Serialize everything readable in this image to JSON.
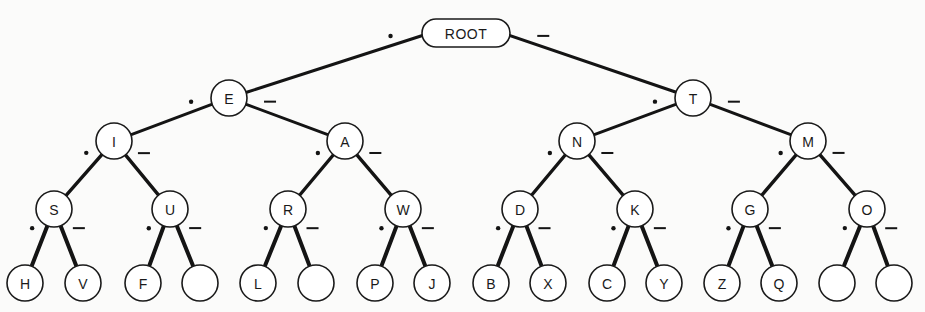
{
  "diagram": {
    "colors": {
      "line": "#141414",
      "node_fill": "#ffffff",
      "node_stroke": "#1a1a1a",
      "background": "#fbfbfa"
    },
    "edge_labels": {
      "dot": "•",
      "dash": "–"
    },
    "root": {
      "id": "root",
      "label": "ROOT",
      "x": 466,
      "y": 33,
      "w": 88,
      "h": 28
    },
    "nodes": [
      {
        "id": "E",
        "label": "E",
        "x": 229,
        "y": 98,
        "level": 1,
        "parent": "root",
        "edge": "dot"
      },
      {
        "id": "T",
        "label": "T",
        "x": 693,
        "y": 98,
        "level": 1,
        "parent": "root",
        "edge": "dash"
      },
      {
        "id": "I",
        "label": "I",
        "x": 114,
        "y": 141,
        "level": 2,
        "parent": "E",
        "edge": "dot"
      },
      {
        "id": "A",
        "label": "A",
        "x": 345,
        "y": 141,
        "level": 2,
        "parent": "E",
        "edge": "dash"
      },
      {
        "id": "N",
        "label": "N",
        "x": 577,
        "y": 141,
        "level": 2,
        "parent": "T",
        "edge": "dot"
      },
      {
        "id": "M",
        "label": "M",
        "x": 808,
        "y": 141,
        "level": 2,
        "parent": "T",
        "edge": "dash"
      },
      {
        "id": "S",
        "label": "S",
        "x": 54,
        "y": 209,
        "level": 3,
        "parent": "I",
        "edge": "dot"
      },
      {
        "id": "U",
        "label": "U",
        "x": 170,
        "y": 209,
        "level": 3,
        "parent": "I",
        "edge": "dash"
      },
      {
        "id": "R",
        "label": "R",
        "x": 288,
        "y": 209,
        "level": 3,
        "parent": "A",
        "edge": "dot"
      },
      {
        "id": "W",
        "label": "W",
        "x": 403,
        "y": 209,
        "level": 3,
        "parent": "A",
        "edge": "dash"
      },
      {
        "id": "D",
        "label": "D",
        "x": 520,
        "y": 209,
        "level": 3,
        "parent": "N",
        "edge": "dot"
      },
      {
        "id": "K",
        "label": "K",
        "x": 635,
        "y": 209,
        "level": 3,
        "parent": "N",
        "edge": "dash"
      },
      {
        "id": "G",
        "label": "G",
        "x": 750,
        "y": 209,
        "level": 3,
        "parent": "M",
        "edge": "dot"
      },
      {
        "id": "O",
        "label": "O",
        "x": 867,
        "y": 209,
        "level": 3,
        "parent": "M",
        "edge": "dash"
      },
      {
        "id": "H",
        "label": "H",
        "x": 25,
        "y": 283,
        "level": 4,
        "parent": "S",
        "edge": "dot"
      },
      {
        "id": "V",
        "label": "V",
        "x": 83,
        "y": 283,
        "level": 4,
        "parent": "S",
        "edge": "dash"
      },
      {
        "id": "F",
        "label": "F",
        "x": 143,
        "y": 283,
        "level": 4,
        "parent": "U",
        "edge": "dot"
      },
      {
        "id": "U_dash",
        "label": "",
        "x": 200,
        "y": 283,
        "level": 4,
        "parent": "U",
        "edge": "dash"
      },
      {
        "id": "L",
        "label": "L",
        "x": 258,
        "y": 283,
        "level": 4,
        "parent": "R",
        "edge": "dot"
      },
      {
        "id": "R_dash",
        "label": "",
        "x": 316,
        "y": 283,
        "level": 4,
        "parent": "R",
        "edge": "dash"
      },
      {
        "id": "P",
        "label": "P",
        "x": 375,
        "y": 283,
        "level": 4,
        "parent": "W",
        "edge": "dot"
      },
      {
        "id": "J",
        "label": "J",
        "x": 432,
        "y": 283,
        "level": 4,
        "parent": "W",
        "edge": "dash"
      },
      {
        "id": "B",
        "label": "B",
        "x": 491,
        "y": 283,
        "level": 4,
        "parent": "D",
        "edge": "dot"
      },
      {
        "id": "X",
        "label": "X",
        "x": 548,
        "y": 283,
        "level": 4,
        "parent": "D",
        "edge": "dash"
      },
      {
        "id": "C",
        "label": "C",
        "x": 607,
        "y": 283,
        "level": 4,
        "parent": "K",
        "edge": "dot"
      },
      {
        "id": "Y",
        "label": "Y",
        "x": 664,
        "y": 283,
        "level": 4,
        "parent": "K",
        "edge": "dash"
      },
      {
        "id": "Z",
        "label": "Z",
        "x": 722,
        "y": 283,
        "level": 4,
        "parent": "G",
        "edge": "dot"
      },
      {
        "id": "Q",
        "label": "Q",
        "x": 779,
        "y": 283,
        "level": 4,
        "parent": "G",
        "edge": "dash"
      },
      {
        "id": "O_dot",
        "label": "",
        "x": 837,
        "y": 283,
        "level": 4,
        "parent": "O",
        "edge": "dot"
      },
      {
        "id": "O_dash",
        "label": "",
        "x": 894,
        "y": 283,
        "level": 4,
        "parent": "O",
        "edge": "dash"
      }
    ]
  }
}
